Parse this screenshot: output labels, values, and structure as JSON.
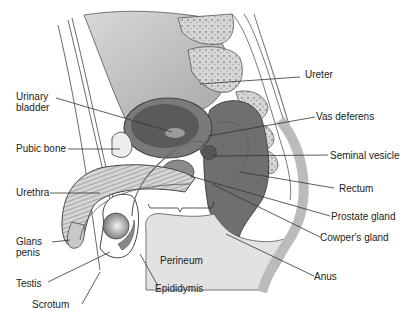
{
  "diagram": {
    "colors": {
      "background": "#ffffff",
      "tissue_light": "#e2e2e2",
      "tissue_mid": "#bdbdbd",
      "tissue_dark": "#6e6e6e",
      "bone": "#d0d0d0",
      "line": "#333333",
      "text": "#222222"
    },
    "labels": [
      {
        "id": "ureter",
        "text": "Ureter"
      },
      {
        "id": "urinary-bladder-1",
        "text": "Urinary"
      },
      {
        "id": "urinary-bladder-2",
        "text": "bladder"
      },
      {
        "id": "vas-deferens",
        "text": "Vas deferens"
      },
      {
        "id": "pubic-bone",
        "text": "Pubic bone"
      },
      {
        "id": "seminal-vesicle",
        "text": "Seminal vesicle"
      },
      {
        "id": "urethra",
        "text": "Urethra"
      },
      {
        "id": "rectum",
        "text": "Rectum"
      },
      {
        "id": "prostate-gland",
        "text": "Prostate gland"
      },
      {
        "id": "cowpers-gland",
        "text": "Cowper's gland"
      },
      {
        "id": "glans-penis-1",
        "text": "Glans"
      },
      {
        "id": "glans-penis-2",
        "text": "penis"
      },
      {
        "id": "perineum",
        "text": "Perineum"
      },
      {
        "id": "testis",
        "text": "Testis"
      },
      {
        "id": "anus",
        "text": "Anus"
      },
      {
        "id": "epididymis",
        "text": "Epididymis"
      },
      {
        "id": "scrotum",
        "text": "Scrotum"
      }
    ]
  }
}
